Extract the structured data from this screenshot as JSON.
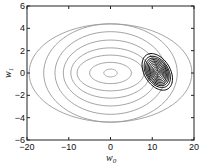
{
  "chart_data": {
    "type": "contour",
    "title": "",
    "xlabel": "w0",
    "xlabel_main": "w",
    "xlabel_sub": "0",
    "ylabel": "w1",
    "ylabel_main": "w",
    "ylabel_sub": "1",
    "xlim": [
      -20,
      20
    ],
    "ylim": [
      -6,
      6
    ],
    "xticks": [
      -20,
      -10,
      0,
      10,
      20
    ],
    "yticks": [
      -6,
      -4,
      -2,
      0,
      2,
      4,
      6
    ],
    "grid": false,
    "legend": null,
    "series": [
      {
        "name": "prior contours",
        "color": "#9a9a9a",
        "center": [
          0,
          0
        ],
        "rotation_deg": 0,
        "ellipses": [
          {
            "rx": 1.6,
            "ry": 0.35
          },
          {
            "rx": 5.0,
            "ry": 0.95
          },
          {
            "rx": 8.0,
            "ry": 1.6
          },
          {
            "rx": 9.5,
            "ry": 2.25
          },
          {
            "rx": 11.3,
            "ry": 2.95
          },
          {
            "rx": 13.3,
            "ry": 3.7
          },
          {
            "rx": 16.0,
            "ry": 4.4
          },
          {
            "rx": 19.5,
            "ry": 4.4
          }
        ]
      },
      {
        "name": "likelihood contours",
        "color": "#000000",
        "center": [
          11.2,
          0.1
        ],
        "rotation_deg": 58,
        "ellipses": [
          {
            "rx": 0.4,
            "ry": 0.1
          },
          {
            "rx": 0.8,
            "ry": 0.2
          },
          {
            "rx": 1.2,
            "ry": 0.3
          },
          {
            "rx": 1.6,
            "ry": 0.4
          },
          {
            "rx": 2.0,
            "ry": 0.5
          },
          {
            "rx": 2.4,
            "ry": 0.6
          },
          {
            "rx": 2.8,
            "ry": 0.7
          },
          {
            "rx": 3.2,
            "ry": 0.8
          },
          {
            "rx": 3.6,
            "ry": 0.9
          },
          {
            "rx": 4.1,
            "ry": 1.0
          },
          {
            "rx": 4.8,
            "ry": 1.15
          }
        ]
      }
    ]
  }
}
